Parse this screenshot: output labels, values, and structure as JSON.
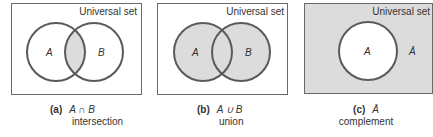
{
  "figure": {
    "universal_label": "Universal set",
    "colors": {
      "stroke": "#5a5a5a",
      "shade": "#dcdcdc",
      "box_border": "#6a6a6a",
      "text": "#333333"
    },
    "panels": [
      {
        "id": "a",
        "tag": "(a)",
        "expression": "A ∩ B",
        "word": "intersection",
        "set_labels": [
          "A",
          "B"
        ],
        "shaded_region": "intersection"
      },
      {
        "id": "b",
        "tag": "(b)",
        "expression": "A ∪ B",
        "word": "union",
        "set_labels": [
          "A",
          "B"
        ],
        "shaded_region": "union"
      },
      {
        "id": "c",
        "tag": "(c)",
        "expression": "Ā",
        "word": "complement",
        "set_labels": [
          "A"
        ],
        "outside_label": "Ā",
        "shaded_region": "complement"
      }
    ]
  }
}
